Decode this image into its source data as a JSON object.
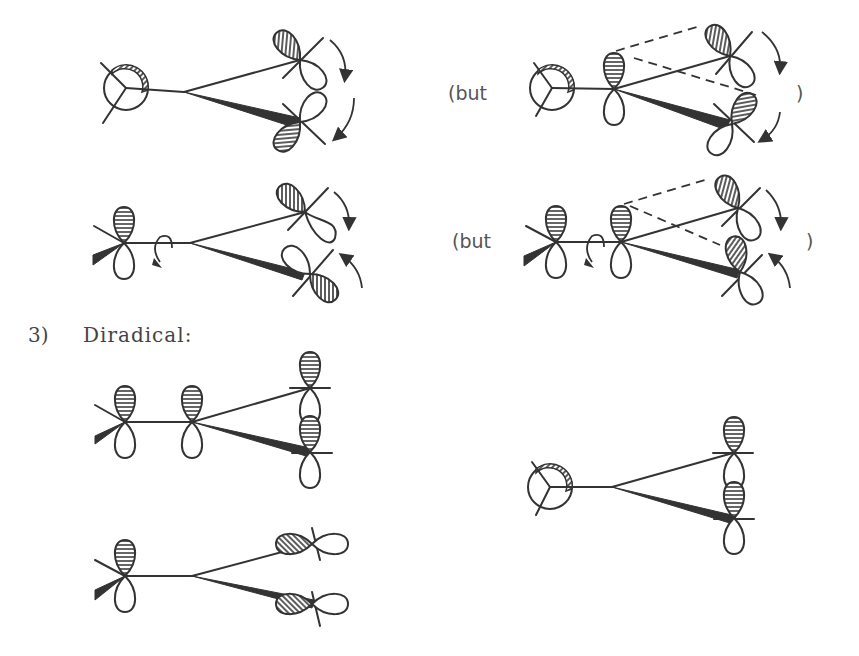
{
  "diagram": {
    "type": "molecular-orbital-conformation-diagram",
    "labels": {
      "but_row1": "(but",
      "close_paren_row1": ")",
      "but_row2": "(but",
      "close_paren_row2": ")",
      "section_number": "3)",
      "section_title": "Diradical:"
    },
    "panels": [
      {
        "id": "row1-left",
        "description": "Newman projection with hatched back orbital; two p-orbitals on the terminal carbons rotating (arrows)"
      },
      {
        "id": "row1-right",
        "description": "Same with central p-orbital; dashed overlap lines to terminal orbitals",
        "label": "(but )"
      },
      {
        "id": "row2-left",
        "description": "Sawhorse view with horizontal-striped p-orbital and rotation arrow; terminal orbitals rotating"
      },
      {
        "id": "row2-right",
        "description": "Same with additional central p-orbital and dashed overlap lines",
        "label": "(but )"
      },
      {
        "id": "diradical-1",
        "description": "Diradical: parallel p-orbitals all aligned vertically"
      },
      {
        "id": "diradical-2",
        "description": "Diradical: terminal orbitals rotated to horizontal"
      },
      {
        "id": "diradical-3",
        "description": "Newman projection diradical with vertically aligned terminal orbitals"
      }
    ]
  }
}
